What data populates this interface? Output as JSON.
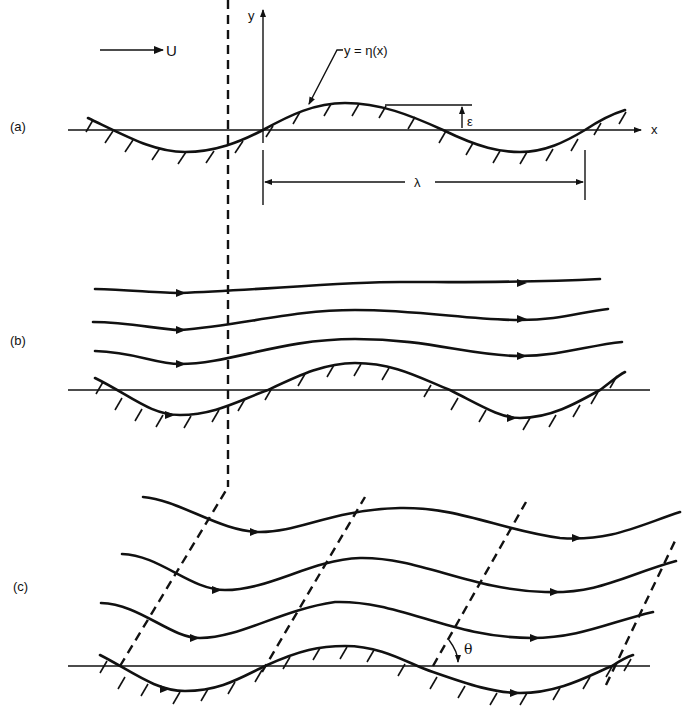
{
  "figure": {
    "panels": [
      {
        "id": "a",
        "label": "(a)",
        "annotations": {
          "free_stream": "U",
          "y_axis": "y",
          "x_axis": "x",
          "surface_equation": "y = η(x)",
          "amplitude": "ε",
          "wavelength": "λ"
        }
      },
      {
        "id": "b",
        "label": "(b)"
      },
      {
        "id": "c",
        "label": "(c)",
        "annotations": {
          "angle": "θ"
        }
      }
    ]
  }
}
